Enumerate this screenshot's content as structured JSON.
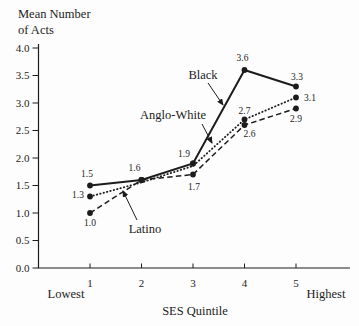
{
  "figure": {
    "background": "#fdfdfd",
    "ink": "#1c1c1c"
  },
  "chart_data": {
    "type": "line",
    "title_lines": [
      "Mean Number",
      "of Acts"
    ],
    "xlabel": "SES Quintile",
    "x_end_labels": {
      "left": "Lowest",
      "right": "Highest"
    },
    "x_tick_labels": [
      "1",
      "2",
      "3",
      "4",
      "5"
    ],
    "y_tick_labels": [
      "0.0",
      "0.5",
      "1.0",
      "1.5",
      "2.0",
      "2.5",
      "3.0",
      "3.5",
      "4.0"
    ],
    "ylim": [
      0,
      4
    ],
    "xlim": [
      1,
      5
    ],
    "grid": false,
    "legend": "inline-annotations",
    "series": [
      {
        "name": "Black",
        "style": "solid",
        "values": [
          1.5,
          1.6,
          1.9,
          3.6,
          3.3
        ]
      },
      {
        "name": "Anglo-White",
        "style": "dotted",
        "values": [
          1.3,
          1.6,
          1.9,
          2.7,
          3.1
        ],
        "render_value_offsets": [
          0,
          -0.045,
          -0.045,
          0,
          0
        ]
      },
      {
        "name": "Latino",
        "style": "dashed",
        "values": [
          1.0,
          1.6,
          1.7,
          2.6,
          2.9
        ]
      }
    ],
    "point_labels": [
      {
        "text": "1.5",
        "q": 1,
        "v": 1.5,
        "dx": -3,
        "dy": -12
      },
      {
        "text": "1.3",
        "q": 1,
        "v": 1.3,
        "dx": -12,
        "dy": -2
      },
      {
        "text": "1.0",
        "q": 1,
        "v": 1.0,
        "dx": 0,
        "dy": 10
      },
      {
        "text": "1.6",
        "q": 2,
        "v": 1.6,
        "dx": -7,
        "dy": -12
      },
      {
        "text": "1.9",
        "q": 3,
        "v": 1.9,
        "dx": -9,
        "dy": -10
      },
      {
        "text": "1.7",
        "q": 3,
        "v": 1.7,
        "dx": 1,
        "dy": 12
      },
      {
        "text": "3.6",
        "q": 4,
        "v": 3.6,
        "dx": -2,
        "dy": -12
      },
      {
        "text": "2.7",
        "q": 4,
        "v": 2.7,
        "dx": 0,
        "dy": -9
      },
      {
        "text": "2.6",
        "q": 4,
        "v": 2.6,
        "dx": 5,
        "dy": 9
      },
      {
        "text": "3.3",
        "q": 5,
        "v": 3.3,
        "dx": 1,
        "dy": -10
      },
      {
        "text": "3.1",
        "q": 5,
        "v": 3.1,
        "dx": 14,
        "dy": 0
      },
      {
        "text": "2.9",
        "q": 5,
        "v": 2.9,
        "dx": 0,
        "dy": 10
      }
    ],
    "annotations": [
      {
        "text": "Black",
        "tx": 203,
        "ty": 75,
        "arrow": {
          "x1": 208,
          "y1": 83,
          "x2": 223,
          "y2": 105
        }
      },
      {
        "text": "Anglo-White",
        "tx": 173,
        "ty": 115,
        "arrow": {
          "x1": 202,
          "y1": 124,
          "x2": 212,
          "y2": 143
        }
      },
      {
        "text": "Latino",
        "tx": 145,
        "ty": 229,
        "arrow": {
          "x1": 137,
          "y1": 220,
          "x2": 123,
          "y2": 191
        }
      }
    ]
  }
}
